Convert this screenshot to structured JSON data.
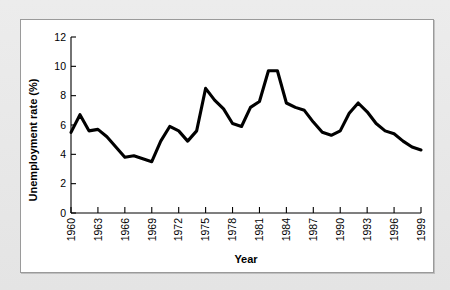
{
  "chart_data": {
    "type": "line",
    "title": "",
    "xlabel": "Year",
    "ylabel": "Unemployment rate (%)",
    "xlim": [
      1960,
      1999
    ],
    "ylim": [
      0,
      12
    ],
    "ytick_step": 2,
    "xtick_step": 3,
    "grid": false,
    "legend": "none",
    "xticks": [
      "1960",
      "1963",
      "1966",
      "1969",
      "1972",
      "1975",
      "1978",
      "1981",
      "1984",
      "1987",
      "1990",
      "1993",
      "1996",
      "1999"
    ],
    "yticks": [
      "0",
      "2",
      "4",
      "6",
      "8",
      "10",
      "12"
    ],
    "series": [
      {
        "name": "Unemployment rate",
        "color": "#000000",
        "x": [
          1960,
          1961,
          1962,
          1963,
          1964,
          1965,
          1966,
          1967,
          1968,
          1969,
          1970,
          1971,
          1972,
          1973,
          1974,
          1975,
          1976,
          1977,
          1978,
          1979,
          1980,
          1981,
          1982,
          1983,
          1984,
          1985,
          1986,
          1987,
          1988,
          1989,
          1990,
          1991,
          1992,
          1993,
          1994,
          1995,
          1996,
          1997,
          1998,
          1999
        ],
        "values": [
          5.5,
          6.7,
          5.6,
          5.7,
          5.2,
          4.5,
          3.8,
          3.9,
          3.7,
          3.5,
          4.9,
          5.9,
          5.6,
          4.9,
          5.6,
          8.5,
          7.7,
          7.1,
          6.1,
          5.9,
          7.2,
          7.6,
          9.7,
          9.7,
          7.5,
          7.2,
          7.0,
          6.2,
          5.5,
          5.3,
          5.6,
          6.8,
          7.5,
          6.9,
          6.1,
          5.6,
          5.4,
          4.9,
          4.5,
          4.3
        ]
      }
    ]
  }
}
